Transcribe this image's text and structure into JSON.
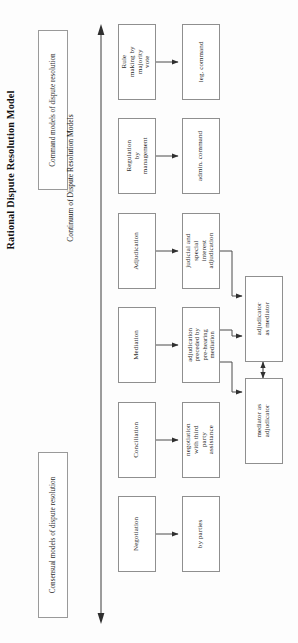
{
  "title": "Rational Dispute Resolution Model",
  "axis": {
    "label": "Continuum of Dispute Resolution Models",
    "top_arrow": "arrow-up",
    "bottom_arrow": "arrow-down"
  },
  "categories": [
    {
      "id": "command",
      "label": "Command models of dispute resolution"
    },
    {
      "id": "consensual",
      "label": "Consensual models of dispute resolution"
    }
  ],
  "rows": [
    {
      "id": "rule-making",
      "process": "Rule making by majority vote",
      "outcome": "leg. command",
      "outcome_id": "leg-command"
    },
    {
      "id": "regulation",
      "process": "Regulation by management",
      "outcome": "admin. command",
      "outcome_id": "admin-command"
    },
    {
      "id": "adjudication",
      "process": "Adjudication",
      "outcome": "judicial and special interest adjudication",
      "outcome_id": "judicial-adjudication"
    },
    {
      "id": "mediation",
      "process": "Mediation",
      "outcome": "adjudication preceded by pre-hearing mediation",
      "outcome_id": "adjudication-preceded"
    },
    {
      "id": "conciliation",
      "process": "Conciliation",
      "outcome": "negotiation with third party assistance",
      "outcome_id": "negotiation-third-party"
    },
    {
      "id": "negotiation",
      "process": "Negotiation",
      "outcome": "by parties",
      "outcome_id": "by-parties"
    }
  ],
  "hybrids": [
    {
      "id": "adjudicator-as-mediator",
      "label": "adjudicator as mediator"
    },
    {
      "id": "mediator-as-adjudicator",
      "label": "mediator as adjudicator"
    }
  ],
  "colors": {
    "border": "#8f8f8f",
    "box_fill": "#ffffff",
    "text": "#2a2a2a",
    "arrow": "#3a3a3a",
    "page_bg": "#fdfdfd"
  }
}
